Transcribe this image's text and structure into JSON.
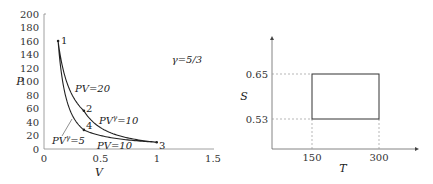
{
  "chart_data": [
    {
      "type": "line",
      "title": "",
      "xlabel": "V",
      "ylabel": "P",
      "xlim": [
        0,
        1.5
      ],
      "ylim": [
        0,
        200
      ],
      "xticks": [
        "0",
        "0.5",
        "1",
        "1.5"
      ],
      "yticks": [
        "0",
        "20",
        "40",
        "60",
        "80",
        "100",
        "120",
        "140",
        "160",
        "180",
        "200"
      ],
      "grid": false,
      "annotation": "γ=5/3",
      "points": [
        {
          "label": "1",
          "V": 0.125,
          "P": 160
        },
        {
          "label": "2",
          "V": 0.354,
          "P": 56.6
        },
        {
          "label": "3",
          "V": 1.0,
          "P": 10
        },
        {
          "label": "4",
          "V": 0.354,
          "P": 28.3
        }
      ],
      "series": [
        {
          "name": "PV=20",
          "from": "1",
          "to": "2",
          "kind": "isotherm",
          "constant": 20
        },
        {
          "name": "PVγ=10",
          "from": "2",
          "to": "3",
          "kind": "adiabat",
          "constant": 10
        },
        {
          "name": "PV=10",
          "from": "3",
          "to": "4",
          "kind": "isotherm",
          "constant": 10
        },
        {
          "name": "PVγ=5",
          "from": "4",
          "to": "1",
          "kind": "adiabat",
          "constant": 5
        }
      ]
    },
    {
      "type": "line",
      "title": "",
      "xlabel": "T",
      "ylabel": "S",
      "xticks": [
        "150",
        "300"
      ],
      "yticks": [
        "0.53",
        "0.65"
      ],
      "grid": false,
      "rectangle": {
        "T": [
          150,
          300
        ],
        "S": [
          0.53,
          0.65
        ]
      }
    }
  ],
  "left": {
    "xlabel": "V",
    "ylabel": "P",
    "gamma": "γ=5/3",
    "xticks": [
      "0",
      "0.5",
      "1",
      "1.5"
    ],
    "yticks": [
      "0",
      "20",
      "40",
      "60",
      "80",
      "100",
      "120",
      "140",
      "160",
      "180",
      "200"
    ],
    "pt1": "1",
    "pt2": "2",
    "pt3": "3",
    "pt4": "4",
    "lab_pv20": "PV=20",
    "lab_pvg10_a": "PV",
    "lab_pvg10_b": "γ",
    "lab_pvg10_c": "=10",
    "lab_pv10": "PV=10",
    "lab_pvg5_a": "PV",
    "lab_pvg5_b": "γ",
    "lab_pvg5_c": "=5"
  },
  "right": {
    "xlabel": "T",
    "ylabel": "S",
    "xt1": "150",
    "xt2": "300",
    "yt1": "0.65",
    "yt2": "0.53"
  }
}
